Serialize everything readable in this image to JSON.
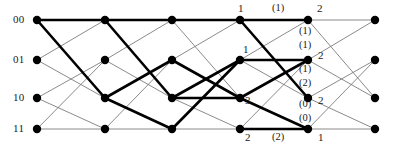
{
  "diagram": {
    "type": "viterbi-trellis",
    "title": "",
    "background_color": "#ffffff",
    "node_color": "#000000",
    "thin_edge_color": "#7d7d7d",
    "bold_edge_color": "#000000",
    "text_color": "#1a1a1a",
    "columns": 6,
    "rows": 4,
    "column_x": [
      37,
      105,
      172,
      240,
      308,
      375
    ],
    "row_y": [
      20,
      60,
      98,
      129
    ],
    "node_radius": 4.2,
    "state_labels": [
      {
        "text": "00",
        "row": 0,
        "x": 13,
        "y": 14
      },
      {
        "text": "01",
        "row": 1,
        "x": 13,
        "y": 54
      },
      {
        "text": "10",
        "row": 2,
        "x": 13,
        "y": 92
      },
      {
        "text": "11",
        "row": 3,
        "x": 13,
        "y": 123
      }
    ],
    "metric_labels": [
      {
        "text": "1",
        "x": 238,
        "y": 3
      },
      {
        "text": "2",
        "x": 317,
        "y": 3
      },
      {
        "text": "1",
        "x": 243,
        "y": 44
      },
      {
        "text": "2",
        "x": 318,
        "y": 50
      },
      {
        "text": "3",
        "x": 245,
        "y": 95
      },
      {
        "text": "2",
        "x": 318,
        "y": 95
      },
      {
        "text": "2",
        "x": 245,
        "y": 132
      },
      {
        "text": "1",
        "x": 318,
        "y": 132
      }
    ],
    "branch_labels": [
      {
        "text": "(1)",
        "x": 272,
        "y": 3
      },
      {
        "text": "(1)",
        "x": 299,
        "y": 26
      },
      {
        "text": "(1)",
        "x": 299,
        "y": 40
      },
      {
        "text": "(1)",
        "x": 299,
        "y": 64
      },
      {
        "text": "(2)",
        "x": 299,
        "y": 78
      },
      {
        "text": "(0)",
        "x": 299,
        "y": 99
      },
      {
        "text": "(0)",
        "x": 299,
        "y": 113
      },
      {
        "text": "(2)",
        "x": 272,
        "y": 132
      }
    ],
    "thin_edges": [
      {
        "from": [
          0,
          0
        ],
        "to": [
          1,
          0
        ]
      },
      {
        "from": [
          0,
          0
        ],
        "to": [
          1,
          2
        ]
      },
      {
        "from": [
          0,
          1
        ],
        "to": [
          1,
          0
        ]
      },
      {
        "from": [
          0,
          1
        ],
        "to": [
          1,
          2
        ]
      },
      {
        "from": [
          0,
          2
        ],
        "to": [
          1,
          1
        ]
      },
      {
        "from": [
          0,
          2
        ],
        "to": [
          1,
          3
        ]
      },
      {
        "from": [
          0,
          3
        ],
        "to": [
          1,
          1
        ]
      },
      {
        "from": [
          0,
          3
        ],
        "to": [
          1,
          3
        ]
      },
      {
        "from": [
          1,
          0
        ],
        "to": [
          2,
          0
        ]
      },
      {
        "from": [
          1,
          0
        ],
        "to": [
          2,
          2
        ]
      },
      {
        "from": [
          1,
          1
        ],
        "to": [
          2,
          0
        ]
      },
      {
        "from": [
          1,
          1
        ],
        "to": [
          2,
          2
        ]
      },
      {
        "from": [
          1,
          2
        ],
        "to": [
          2,
          1
        ]
      },
      {
        "from": [
          1,
          2
        ],
        "to": [
          2,
          3
        ]
      },
      {
        "from": [
          1,
          3
        ],
        "to": [
          2,
          1
        ]
      },
      {
        "from": [
          1,
          3
        ],
        "to": [
          2,
          3
        ]
      },
      {
        "from": [
          2,
          0
        ],
        "to": [
          3,
          0
        ]
      },
      {
        "from": [
          2,
          0
        ],
        "to": [
          3,
          2
        ]
      },
      {
        "from": [
          2,
          1
        ],
        "to": [
          3,
          0
        ]
      },
      {
        "from": [
          2,
          1
        ],
        "to": [
          3,
          2
        ]
      },
      {
        "from": [
          2,
          2
        ],
        "to": [
          3,
          1
        ]
      },
      {
        "from": [
          2,
          2
        ],
        "to": [
          3,
          3
        ]
      },
      {
        "from": [
          2,
          3
        ],
        "to": [
          3,
          1
        ]
      },
      {
        "from": [
          2,
          3
        ],
        "to": [
          3,
          3
        ]
      },
      {
        "from": [
          3,
          0
        ],
        "to": [
          4,
          0
        ]
      },
      {
        "from": [
          3,
          0
        ],
        "to": [
          4,
          2
        ]
      },
      {
        "from": [
          3,
          1
        ],
        "to": [
          4,
          0
        ]
      },
      {
        "from": [
          3,
          1
        ],
        "to": [
          4,
          2
        ]
      },
      {
        "from": [
          3,
          2
        ],
        "to": [
          4,
          1
        ]
      },
      {
        "from": [
          3,
          2
        ],
        "to": [
          4,
          3
        ]
      },
      {
        "from": [
          3,
          3
        ],
        "to": [
          4,
          1
        ]
      },
      {
        "from": [
          3,
          3
        ],
        "to": [
          4,
          3
        ]
      },
      {
        "from": [
          4,
          0
        ],
        "to": [
          5,
          0
        ]
      },
      {
        "from": [
          4,
          0
        ],
        "to": [
          5,
          2
        ]
      },
      {
        "from": [
          4,
          1
        ],
        "to": [
          5,
          0
        ]
      },
      {
        "from": [
          4,
          1
        ],
        "to": [
          5,
          2
        ]
      },
      {
        "from": [
          4,
          2
        ],
        "to": [
          5,
          1
        ]
      },
      {
        "from": [
          4,
          2
        ],
        "to": [
          5,
          3
        ]
      },
      {
        "from": [
          4,
          3
        ],
        "to": [
          5,
          1
        ]
      },
      {
        "from": [
          4,
          3
        ],
        "to": [
          5,
          3
        ]
      }
    ],
    "bold_edges": [
      {
        "from": [
          0,
          0
        ],
        "to": [
          1,
          0
        ]
      },
      {
        "from": [
          0,
          0
        ],
        "to": [
          1,
          2
        ]
      },
      {
        "from": [
          1,
          0
        ],
        "to": [
          2,
          0
        ]
      },
      {
        "from": [
          1,
          0
        ],
        "to": [
          2,
          2
        ]
      },
      {
        "from": [
          1,
          2
        ],
        "to": [
          2,
          1
        ]
      },
      {
        "from": [
          1,
          2
        ],
        "to": [
          2,
          3
        ]
      },
      {
        "from": [
          2,
          0
        ],
        "to": [
          3,
          0
        ]
      },
      {
        "from": [
          2,
          1
        ],
        "to": [
          3,
          2
        ]
      },
      {
        "from": [
          2,
          2
        ],
        "to": [
          3,
          1
        ]
      },
      {
        "from": [
          2,
          2
        ],
        "to": [
          3,
          2
        ]
      },
      {
        "from": [
          2,
          3
        ],
        "to": [
          3,
          1
        ]
      },
      {
        "from": [
          3,
          0
        ],
        "to": [
          4,
          0
        ]
      },
      {
        "from": [
          3,
          0
        ],
        "to": [
          4,
          2
        ]
      },
      {
        "from": [
          3,
          1
        ],
        "to": [
          4,
          1
        ]
      },
      {
        "from": [
          3,
          2
        ],
        "to": [
          4,
          1
        ]
      },
      {
        "from": [
          3,
          3
        ],
        "to": [
          4,
          3
        ]
      },
      {
        "from": [
          3,
          2
        ],
        "to": [
          4,
          3
        ]
      }
    ]
  }
}
